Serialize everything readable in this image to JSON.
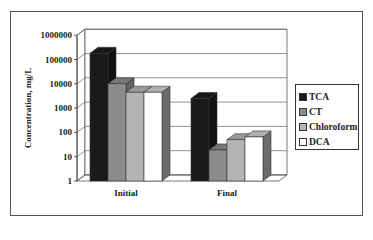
{
  "chart_data": {
    "type": "bar",
    "title": "",
    "xlabel": "",
    "ylabel": "Concentration, mg/L",
    "yscale": "log",
    "ylim": [
      1,
      1000000
    ],
    "yticks": [
      "1",
      "10",
      "100",
      "1000",
      "10000",
      "100000",
      "1000000"
    ],
    "categories": [
      "Initial",
      "Final"
    ],
    "series": [
      {
        "name": "TCA",
        "color": "#1a1a1a",
        "values": [
          180000,
          2500
        ]
      },
      {
        "name": "CT",
        "color": "#8c8c8c",
        "values": [
          10000,
          19
        ]
      },
      {
        "name": "Chloroform",
        "color": "#b4b4b4",
        "values": [
          4500,
          50
        ]
      },
      {
        "name": "DCA",
        "color": "#ffffff",
        "values": [
          4500,
          65
        ]
      }
    ],
    "grid": true,
    "legend_position": "right",
    "style": "3d-clustered-column"
  },
  "legend": {
    "items": [
      {
        "label": "TCA",
        "color": "#1a1a1a"
      },
      {
        "label": "CT",
        "color": "#8c8c8c"
      },
      {
        "label": "Chloroform",
        "color": "#b4b4b4"
      },
      {
        "label": "DCA",
        "color": "#ffffff"
      }
    ]
  }
}
